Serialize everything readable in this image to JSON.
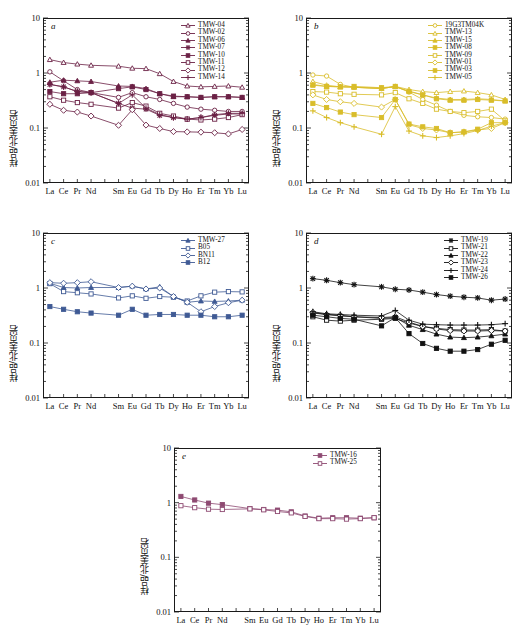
{
  "figure": {
    "y_axis_label": "样品/北美页岩",
    "y_ticks": [
      "10",
      "1",
      "0.1",
      "0.01"
    ],
    "y_range": [
      0.01,
      10
    ],
    "x_categories": [
      "La",
      "Ce",
      "Pr",
      "Nd",
      "Pm",
      "Sm",
      "Eu",
      "Gd",
      "Tb",
      "Dy",
      "Ho",
      "Er",
      "Tm",
      "Yb",
      "Lu"
    ],
    "x_visible_ticks": [
      "La",
      "Ce",
      "Pr",
      "Nd",
      "Sm",
      "Eu",
      "Gd",
      "Tb",
      "Dy",
      "Ho",
      "Er",
      "Tm",
      "Yb",
      "Lu"
    ]
  },
  "chart_data": [
    {
      "type": "line",
      "panel": "a",
      "title": "a",
      "xlabel": "",
      "ylabel": "样品/北美页岩",
      "ylim": [
        0.01,
        10
      ],
      "grid": false,
      "legend_position": "top-right",
      "color": "#6b2145",
      "categories": [
        "La",
        "Ce",
        "Pr",
        "Nd",
        "Sm",
        "Eu",
        "Gd",
        "Tb",
        "Dy",
        "Ho",
        "Er",
        "Tm",
        "Yb",
        "Lu"
      ],
      "series": [
        {
          "name": "TMW-04",
          "marker": "triangle-open",
          "values": [
            1.75,
            1.55,
            1.45,
            1.38,
            1.33,
            1.22,
            1.2,
            0.97,
            0.7,
            0.58,
            0.56,
            0.57,
            0.58,
            0.55
          ]
        },
        {
          "name": "TMW-02",
          "marker": "circle-open",
          "values": [
            1.05,
            0.72,
            0.5,
            0.44,
            0.36,
            0.44,
            0.37,
            0.33,
            0.28,
            0.24,
            0.22,
            0.21,
            0.2,
            0.2
          ]
        },
        {
          "name": "TMW-06",
          "marker": "triangle-filled",
          "values": [
            0.68,
            0.74,
            0.72,
            0.7,
            0.58,
            0.57,
            0.52,
            0.42,
            0.37,
            0.37,
            0.36,
            0.37,
            0.37,
            0.36
          ]
        },
        {
          "name": "TMW-07",
          "marker": "star",
          "values": [
            0.62,
            0.56,
            0.46,
            0.44,
            0.28,
            0.23,
            0.22,
            0.17,
            0.155,
            0.145,
            0.155,
            0.17,
            0.18,
            0.18
          ]
        },
        {
          "name": "TMW-10",
          "marker": "square-filled",
          "values": [
            0.46,
            0.42,
            0.42,
            0.44,
            0.52,
            0.56,
            0.5,
            0.42,
            0.38,
            0.37,
            0.36,
            0.37,
            0.37,
            0.36
          ]
        },
        {
          "name": "TMW-11",
          "marker": "square-open",
          "values": [
            0.37,
            0.32,
            0.29,
            0.27,
            0.23,
            0.29,
            0.25,
            0.185,
            0.165,
            0.145,
            0.14,
            0.145,
            0.155,
            0.175
          ]
        },
        {
          "name": "TMW-12",
          "marker": "diamond-open",
          "values": [
            0.27,
            0.21,
            0.195,
            0.165,
            0.112,
            0.215,
            0.113,
            0.098,
            0.086,
            0.085,
            0.084,
            0.082,
            0.078,
            0.094
          ]
        },
        {
          "name": "TMW-14",
          "marker": "cross",
          "values": [
            0.62,
            0.56,
            0.46,
            0.44,
            0.28,
            0.4,
            0.23,
            0.175,
            0.155,
            0.145,
            0.155,
            0.175,
            0.185,
            0.185
          ]
        }
      ]
    },
    {
      "type": "line",
      "panel": "b",
      "title": "b",
      "xlabel": "",
      "ylabel": "样品/北美页岩",
      "ylim": [
        0.01,
        10
      ],
      "grid": false,
      "legend_position": "top-right",
      "color": "#d9bd2a",
      "categories": [
        "La",
        "Ce",
        "Pr",
        "Nd",
        "Sm",
        "Eu",
        "Gd",
        "Tb",
        "Dy",
        "Ho",
        "Er",
        "Tm",
        "Yb",
        "Lu"
      ],
      "series": [
        {
          "name": "19G3TM04K",
          "marker": "circle-open",
          "values": [
            0.92,
            0.88,
            0.62,
            0.55,
            0.52,
            0.57,
            0.45,
            0.33,
            0.26,
            0.2,
            0.17,
            0.16,
            0.155,
            0.145
          ]
        },
        {
          "name": "TMW-13",
          "marker": "triangle-open",
          "values": [
            0.7,
            0.6,
            0.56,
            0.55,
            0.52,
            0.57,
            0.5,
            0.46,
            0.44,
            0.46,
            0.47,
            0.44,
            0.4,
            0.33
          ]
        },
        {
          "name": "TMW-15",
          "marker": "triangle-filled",
          "values": [
            0.62,
            0.57,
            0.56,
            0.55,
            0.53,
            0.56,
            0.47,
            0.4,
            0.35,
            0.33,
            0.33,
            0.34,
            0.33,
            0.31
          ]
        },
        {
          "name": "TMW-08",
          "marker": "square-filled",
          "values": [
            0.6,
            0.57,
            0.56,
            0.57,
            0.54,
            0.57,
            0.46,
            0.4,
            0.34,
            0.32,
            0.32,
            0.33,
            0.32,
            0.31
          ]
        },
        {
          "name": "TMW-09",
          "marker": "square-open",
          "values": [
            0.46,
            0.45,
            0.42,
            0.41,
            0.4,
            0.44,
            0.34,
            0.28,
            0.22,
            0.2,
            0.19,
            0.2,
            0.22,
            0.135
          ]
        },
        {
          "name": "TMW-01",
          "marker": "diamond-open",
          "values": [
            0.4,
            0.33,
            0.3,
            0.28,
            0.24,
            0.33,
            0.115,
            0.098,
            0.092,
            0.082,
            0.085,
            0.092,
            0.098,
            0.125
          ]
        },
        {
          "name": "TMW-03",
          "marker": "square-filled2",
          "values": [
            0.28,
            0.235,
            0.195,
            0.175,
            0.155,
            0.33,
            0.118,
            0.105,
            0.098,
            0.082,
            0.085,
            0.095,
            0.125,
            0.125
          ]
        },
        {
          "name": "TMW-05",
          "marker": "cross",
          "values": [
            0.205,
            0.155,
            0.125,
            0.105,
            0.077,
            0.245,
            0.088,
            0.072,
            0.067,
            0.072,
            0.079,
            0.09,
            0.108,
            0.125
          ]
        }
      ]
    },
    {
      "type": "line",
      "panel": "c",
      "title": "c",
      "xlabel": "",
      "ylabel": "样品/北美页岩",
      "ylim": [
        0.01,
        10
      ],
      "grid": false,
      "legend_position": "top-right",
      "color": "#3f5a94",
      "categories": [
        "La",
        "Ce",
        "Pr",
        "Nd",
        "Sm",
        "Eu",
        "Gd",
        "Tb",
        "Dy",
        "Ho",
        "Er",
        "Tm",
        "Yb",
        "Lu"
      ],
      "series": [
        {
          "name": "TMW-27",
          "marker": "triangle-filled",
          "values": [
            1.22,
            1.02,
            1.0,
            1.02,
            1.02,
            1.08,
            0.96,
            1.05,
            0.7,
            0.55,
            0.58,
            0.57,
            0.58,
            0.6
          ]
        },
        {
          "name": "B05",
          "marker": "square-open",
          "values": [
            1.2,
            0.86,
            0.82,
            0.78,
            0.66,
            0.72,
            0.65,
            0.7,
            0.68,
            0.58,
            0.72,
            0.84,
            0.86,
            0.85
          ]
        },
        {
          "name": "BN11",
          "marker": "diamond-open",
          "values": [
            1.25,
            1.22,
            1.25,
            1.3,
            1.02,
            1.08,
            0.96,
            1.0,
            0.7,
            0.55,
            0.37,
            0.46,
            0.54,
            0.6
          ]
        },
        {
          "name": "B12",
          "marker": "square-filled",
          "values": [
            0.46,
            0.41,
            0.37,
            0.35,
            0.32,
            0.41,
            0.32,
            0.33,
            0.33,
            0.32,
            0.32,
            0.3,
            0.3,
            0.32
          ]
        }
      ]
    },
    {
      "type": "line",
      "panel": "d",
      "title": "d",
      "xlabel": "",
      "ylabel": "样品/北美页岩",
      "ylim": [
        0.01,
        10
      ],
      "grid": false,
      "legend_position": "top-right",
      "color": "#111111",
      "categories": [
        "La",
        "Ce",
        "Pr",
        "Nd",
        "Sm",
        "Eu",
        "Gd",
        "Tb",
        "Dy",
        "Ho",
        "Er",
        "Tm",
        "Yb",
        "Lu"
      ],
      "series": [
        {
          "name": "TMW-19",
          "marker": "star",
          "values": [
            1.48,
            1.38,
            1.25,
            1.15,
            1.05,
            0.95,
            0.92,
            0.84,
            0.76,
            0.71,
            0.68,
            0.66,
            0.6,
            0.63
          ]
        },
        {
          "name": "TMW-21",
          "marker": "square-open",
          "values": [
            0.3,
            0.26,
            0.25,
            0.26,
            0.27,
            0.28,
            0.23,
            0.2,
            0.185,
            0.175,
            0.172,
            0.172,
            0.175,
            0.165
          ]
        },
        {
          "name": "TMW-22",
          "marker": "triangle-filled",
          "values": [
            0.35,
            0.33,
            0.31,
            0.3,
            0.28,
            0.29,
            0.21,
            0.175,
            0.145,
            0.128,
            0.125,
            0.128,
            0.135,
            0.145
          ]
        },
        {
          "name": "TMW-23",
          "marker": "diamond-open",
          "values": [
            0.36,
            0.33,
            0.32,
            0.3,
            0.29,
            0.3,
            0.24,
            0.2,
            0.18,
            0.168,
            0.165,
            0.165,
            0.168,
            0.165
          ]
        },
        {
          "name": "TMW-24",
          "marker": "cross",
          "values": [
            0.37,
            0.34,
            0.33,
            0.32,
            0.31,
            0.39,
            0.26,
            0.22,
            0.215,
            0.212,
            0.212,
            0.212,
            0.215,
            0.225
          ]
        },
        {
          "name": "TMW-26",
          "marker": "square-filled",
          "values": [
            0.32,
            0.3,
            0.28,
            0.27,
            0.205,
            0.29,
            0.148,
            0.098,
            0.08,
            0.071,
            0.071,
            0.076,
            0.095,
            0.112
          ]
        }
      ]
    },
    {
      "type": "line",
      "panel": "e",
      "title": "e",
      "xlabel": "",
      "ylabel": "样品/北美页岩",
      "ylim": [
        0.01,
        10
      ],
      "grid": false,
      "legend_position": "top-right",
      "color": "#8e4a72",
      "categories": [
        "La",
        "Ce",
        "Pr",
        "Nd",
        "Sm",
        "Eu",
        "Gd",
        "Tb",
        "Dy",
        "Ho",
        "Er",
        "Tm",
        "Yb",
        "Lu"
      ],
      "series": [
        {
          "name": "TMW-16",
          "marker": "square-filled",
          "values": [
            1.3,
            1.12,
            0.98,
            0.92,
            0.78,
            0.75,
            0.73,
            0.68,
            0.57,
            0.52,
            0.53,
            0.53,
            0.52,
            0.53
          ]
        },
        {
          "name": "TMW-25",
          "marker": "square-open",
          "values": [
            0.88,
            0.81,
            0.76,
            0.75,
            0.77,
            0.74,
            0.69,
            0.65,
            0.56,
            0.51,
            0.51,
            0.5,
            0.51,
            0.53
          ]
        }
      ]
    }
  ]
}
